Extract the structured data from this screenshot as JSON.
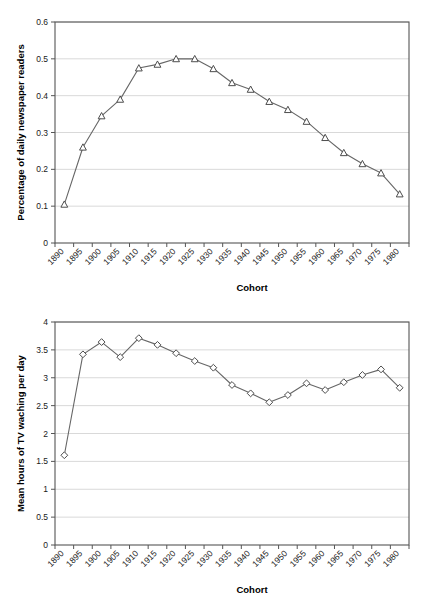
{
  "document": {
    "kind": "two-panel-line-chart-figure",
    "background_color": "#ffffff",
    "line_color": "#666666",
    "marker_stroke_color": "#4d4d4d",
    "grid_color": "#d9d9d9",
    "frame_color": "#555555"
  },
  "chart_data": [
    {
      "panel": "top",
      "type": "line",
      "title": "",
      "xlabel": "Cohort",
      "ylabel": "Percentage of daily newspaper readers",
      "marker": "open-triangle",
      "grid": true,
      "grid_axis": "y",
      "legend": false,
      "xlim": [
        1890,
        1980
      ],
      "ylim": [
        0,
        0.6
      ],
      "ytick_values": [
        0,
        0.1,
        0.2,
        0.3,
        0.4,
        0.5,
        0.6
      ],
      "ytick_labels": [
        "0",
        "0.1",
        "0.2",
        "0.3",
        "0.4",
        "0.5",
        "0.6"
      ],
      "categories": [
        "1890",
        "1895",
        "1900",
        "1905",
        "1910",
        "1915",
        "1920",
        "1925",
        "1930",
        "1935",
        "1940",
        "1945",
        "1950",
        "1955",
        "1960",
        "1965",
        "1970",
        "1975",
        "1980"
      ],
      "values": [
        0.105,
        0.26,
        0.345,
        0.39,
        0.475,
        0.485,
        0.5,
        0.5,
        0.473,
        0.435,
        0.417,
        0.384,
        0.362,
        0.33,
        0.286,
        0.245,
        0.215,
        0.19,
        0.133
      ]
    },
    {
      "panel": "bottom",
      "type": "line",
      "title": "",
      "xlabel": "Cohort",
      "ylabel": "Mean hours of TV waching per day",
      "marker": "open-diamond",
      "grid": true,
      "grid_axis": "y",
      "legend": false,
      "xlim": [
        1890,
        1980
      ],
      "ylim": [
        0,
        4
      ],
      "ytick_values": [
        0,
        0.5,
        1,
        1.5,
        2,
        2.5,
        3,
        3.5,
        4
      ],
      "ytick_labels": [
        "0",
        "0.5",
        "1",
        "1.5",
        "2",
        "2.5",
        "3",
        "3.5",
        "4"
      ],
      "categories": [
        "1890",
        "1895",
        "1900",
        "1905",
        "1910",
        "1915",
        "1920",
        "1925",
        "1930",
        "1935",
        "1940",
        "1945",
        "1950",
        "1955",
        "1960",
        "1965",
        "1970",
        "1975",
        "1980"
      ],
      "values": [
        1.61,
        3.42,
        3.64,
        3.37,
        3.71,
        3.59,
        3.44,
        3.3,
        3.18,
        2.87,
        2.72,
        2.56,
        2.69,
        2.9,
        2.78,
        2.92,
        3.05,
        3.15,
        2.82
      ]
    }
  ]
}
